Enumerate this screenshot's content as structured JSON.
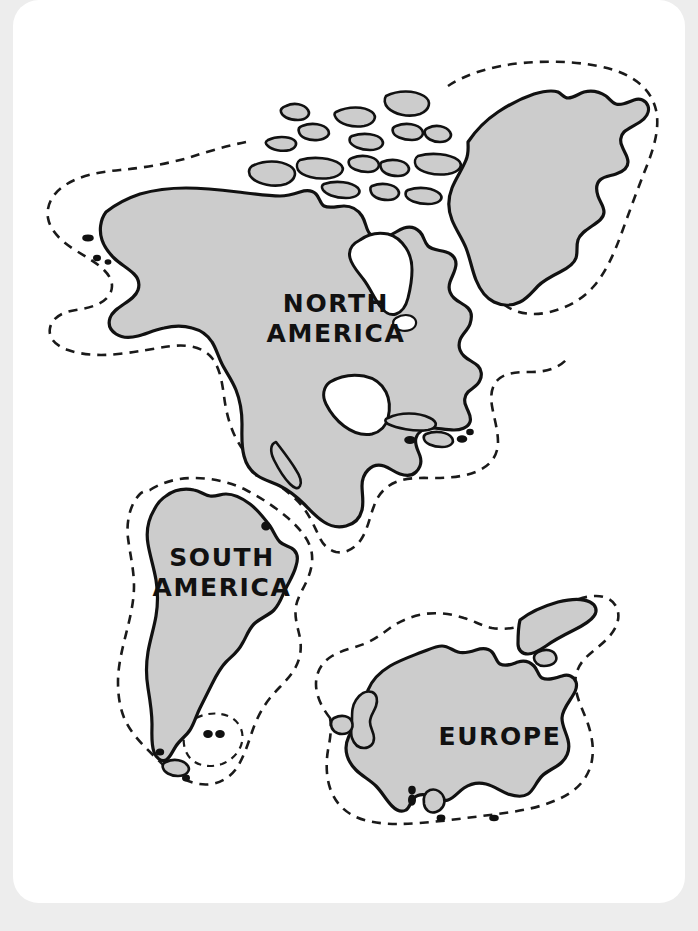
{
  "page": {
    "background_color": "#ededed",
    "paper_color": "#ffffff",
    "land_fill_color": "#cccccc",
    "outline_color": "#111111",
    "shelf_line_style": "dashed"
  },
  "map": {
    "type": "continent-outline-map",
    "description": "Hand-drawn style outline map showing three landmasses with dashed continental shelf boundaries",
    "continents": [
      {
        "id": "north-america",
        "label_lines": [
          "NORTH",
          "AMERICA"
        ],
        "label_line_1": "NORTH",
        "label_line_2": "AMERICA",
        "label_x": 336,
        "label_y_1": 312,
        "label_y_2": 342,
        "has_shelf_outline": true,
        "fill": "#cccccc"
      },
      {
        "id": "south-america",
        "label_lines": [
          "SOUTH",
          "AMERICA"
        ],
        "label_line_1": "SOUTH",
        "label_line_2": "AMERICA",
        "label_x": 222,
        "label_y_1": 566,
        "label_y_2": 596,
        "has_shelf_outline": true,
        "fill": "#cccccc"
      },
      {
        "id": "europe",
        "label_lines": [
          "EUROPE"
        ],
        "label_line_1": "EUROPE",
        "label_x": 500,
        "label_y_1": 745,
        "has_shelf_outline": true,
        "fill": "#cccccc"
      }
    ]
  }
}
